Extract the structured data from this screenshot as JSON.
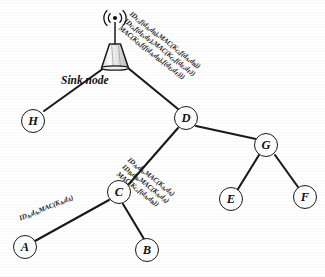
{
  "figure": {
    "type": "network-tree-diagram",
    "title": "",
    "sink_label": "Sink node"
  },
  "nodes": [
    {
      "id": "sink",
      "label": "",
      "icon": "antenna-tower-icon",
      "x": 115,
      "y": 46
    },
    {
      "id": "H",
      "label": "H",
      "x": 33,
      "y": 121
    },
    {
      "id": "D",
      "label": "D",
      "x": 186,
      "y": 118
    },
    {
      "id": "G",
      "label": "G",
      "x": 266,
      "y": 145
    },
    {
      "id": "C",
      "label": "C",
      "x": 119,
      "y": 192
    },
    {
      "id": "A",
      "label": "A",
      "x": 25,
      "y": 247
    },
    {
      "id": "B",
      "label": "B",
      "x": 147,
      "y": 250
    },
    {
      "id": "E",
      "label": "E",
      "x": 231,
      "y": 199
    },
    {
      "id": "F",
      "label": "F",
      "x": 305,
      "y": 197
    }
  ],
  "edges": [
    {
      "from": "sink",
      "to": "H"
    },
    {
      "from": "sink",
      "to": "D"
    },
    {
      "from": "D",
      "to": "C"
    },
    {
      "from": "D",
      "to": "G"
    },
    {
      "from": "C",
      "to": "A"
    },
    {
      "from": "C",
      "to": "B"
    },
    {
      "from": "G",
      "to": "E"
    },
    {
      "from": "G",
      "to": "F"
    }
  ],
  "labels": {
    "sink_to_d": {
      "name": "message-label-d-to-sink",
      "edge": "D -> sink",
      "rotation_deg": 38,
      "lines": [
        "IDC,f(dA,dB),MAC(KC,f(dA,dB))",
        "IDG,f(dE,dF),MAC(KG,f(dE,dF))",
        "MAC(KD,f(f(dA,dB),f(dE,dF)))"
      ],
      "lines_parts": [
        [
          {
            "t": "ID"
          },
          {
            "s": "C"
          },
          {
            "t": ",f(d"
          },
          {
            "s": "A"
          },
          {
            "t": ",d"
          },
          {
            "s": "B"
          },
          {
            "t": "),MAC(K"
          },
          {
            "s": "C"
          },
          {
            "t": ",f(d"
          },
          {
            "s": "A"
          },
          {
            "t": ",d"
          },
          {
            "s": "B"
          },
          {
            "t": "))"
          }
        ],
        [
          {
            "t": "ID"
          },
          {
            "s": "G"
          },
          {
            "t": ",f(d"
          },
          {
            "s": "E"
          },
          {
            "t": ",d"
          },
          {
            "s": "F"
          },
          {
            "t": "),MAC(K"
          },
          {
            "s": "G"
          },
          {
            "t": ",f(d"
          },
          {
            "s": "E"
          },
          {
            "t": ",d"
          },
          {
            "s": "F"
          },
          {
            "t": "))"
          }
        ],
        [
          {
            "t": "MAC(K"
          },
          {
            "s": "D"
          },
          {
            "t": ",f(f(d"
          },
          {
            "s": "A"
          },
          {
            "t": ",d"
          },
          {
            "s": "B"
          },
          {
            "t": "),f(d"
          },
          {
            "s": "E"
          },
          {
            "t": ",d"
          },
          {
            "s": "F"
          },
          {
            "t": ")))"
          }
        ]
      ]
    },
    "c_to_d": {
      "name": "message-label-c-to-d",
      "edge": "C -> D",
      "rotation_deg": 38,
      "lines": [
        "IDA,dA,MAC(KA,dA)",
        "IDB,dB,MAC(KA,dA)",
        "MAC(KC,f(dA,dB))"
      ],
      "lines_parts": [
        [
          {
            "t": "ID"
          },
          {
            "s": "A"
          },
          {
            "t": ",d"
          },
          {
            "s": "A"
          },
          {
            "t": ",MAC(K"
          },
          {
            "s": "A"
          },
          {
            "t": ",d"
          },
          {
            "s": "A"
          },
          {
            "t": ")"
          }
        ],
        [
          {
            "t": "ID"
          },
          {
            "s": "B"
          },
          {
            "t": ",d"
          },
          {
            "s": "B"
          },
          {
            "t": ",MAC(K"
          },
          {
            "s": "A"
          },
          {
            "t": ",d"
          },
          {
            "s": "A"
          },
          {
            "t": ")"
          }
        ],
        [
          {
            "t": "MAC(K"
          },
          {
            "s": "C"
          },
          {
            "t": ",f(d"
          },
          {
            "s": "A"
          },
          {
            "t": ",d"
          },
          {
            "s": "B"
          },
          {
            "t": "))"
          }
        ]
      ]
    },
    "a_to_c": {
      "name": "message-label-a-to-c",
      "edge": "A -> C",
      "rotation_deg": -22,
      "lines": [
        "IDA,dA,MAC(KA,dA)"
      ],
      "lines_parts": [
        [
          {
            "t": "ID"
          },
          {
            "s": "A"
          },
          {
            "t": ",d"
          },
          {
            "s": "A"
          },
          {
            "t": ",MAC(K"
          },
          {
            "s": "A"
          },
          {
            "t": ",d"
          },
          {
            "s": "A"
          },
          {
            "t": ")"
          }
        ]
      ]
    }
  },
  "colors": {
    "line": "#1a1a1a",
    "node_fill": "#ffffff",
    "text": "#111111",
    "background": "#ffffff",
    "tower_fill": "#e9e9e9"
  }
}
